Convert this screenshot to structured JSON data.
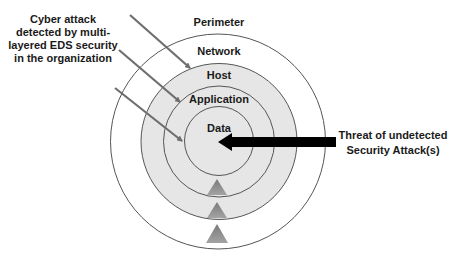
{
  "diagram": {
    "left_caption": {
      "lines": [
        "Cyber attack",
        "detected by multi-",
        "layered EDS security",
        "in the organization"
      ]
    },
    "right_caption": {
      "lines": [
        "Threat of undetected",
        "Security Attack(s)"
      ]
    },
    "layers": {
      "perimeter": "Perimeter",
      "network": "Network",
      "host": "Host",
      "application": "Application",
      "data": "Data"
    },
    "colors": {
      "ring_fill": "#e6e6e6",
      "circle_stroke": "#555555",
      "attack_arrow": "#000000",
      "detected_arrows": "#6e6e6e",
      "triangles": "#8c8c8c"
    }
  }
}
